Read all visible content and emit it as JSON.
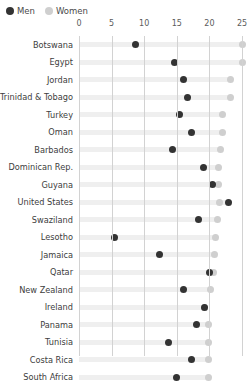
{
  "legend": {
    "items": [
      {
        "label": "Men",
        "color": "#333333",
        "icon": "filled-circle-icon"
      },
      {
        "label": "Women",
        "color": "#cfcfcf",
        "icon": "filled-circle-icon"
      }
    ]
  },
  "chart_data": {
    "type": "scatter",
    "title": "",
    "subtitle": "",
    "xlabel": "",
    "ylabel": "",
    "xlim": [
      0,
      25
    ],
    "xticks": [
      0,
      5,
      10,
      15,
      20,
      25
    ],
    "xtick_labels": [
      "0",
      "5",
      "10",
      "15",
      "20",
      "25"
    ],
    "grid": true,
    "legend_position": "top-left",
    "orientation": "horizontal",
    "categories": [
      "Botswana",
      "Egypt",
      "Jordan",
      "Trinidad & Tobago",
      "Turkey",
      "Oman",
      "Barbados",
      "Dominican Rep.",
      "Guyana",
      "United States",
      "Swaziland",
      "Lesotho",
      "Jamaica",
      "Qatar",
      "New Zealand",
      "Ireland",
      "Panama",
      "Tunisia",
      "Costa Rica",
      "South Africa"
    ],
    "series": [
      {
        "name": "Men",
        "color": "#333333",
        "values": [
          8.6,
          14.7,
          16.0,
          16.6,
          15.4,
          17.3,
          14.3,
          19.1,
          20.4,
          22.9,
          18.3,
          5.4,
          12.3,
          20.0,
          16.0,
          19.3,
          18.0,
          13.8,
          17.2,
          14.9
        ]
      },
      {
        "name": "Women",
        "color": "#cfcfcf",
        "values": [
          25.0,
          25.0,
          23.3,
          23.3,
          22.0,
          22.0,
          21.7,
          21.4,
          21.4,
          21.5,
          21.2,
          21.0,
          20.8,
          20.6,
          20.2,
          19.3,
          19.9,
          19.9,
          19.8,
          19.8
        ]
      }
    ]
  }
}
